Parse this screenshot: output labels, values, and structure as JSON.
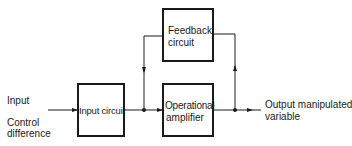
{
  "diagram": {
    "type": "block-diagram",
    "title": "",
    "blocks": {
      "input_circuit": {
        "label": "Input circuit"
      },
      "feedback_circuit": {
        "label_line1": "Feedback",
        "label_line2": "circuit"
      },
      "operational_amplifier": {
        "label_line1": "Operational",
        "label_line2": "amplifier"
      }
    },
    "inputs": {
      "line1": "Input",
      "line2": "Control",
      "line3": "difference"
    },
    "outputs": {
      "line1": "Output manipulated",
      "line2": "variable"
    },
    "connections": [
      {
        "from": "Input",
        "to": "Input circuit"
      },
      {
        "from": "Input circuit",
        "to": "Operational amplifier"
      },
      {
        "from": "Operational amplifier",
        "to": "Output manipulated variable"
      },
      {
        "from": "Output junction",
        "to": "Feedback circuit"
      },
      {
        "from": "Feedback circuit",
        "to": "Operational amplifier input junction"
      }
    ],
    "colors": {
      "line": "#1a1a1a",
      "background": "#ffffff"
    }
  }
}
